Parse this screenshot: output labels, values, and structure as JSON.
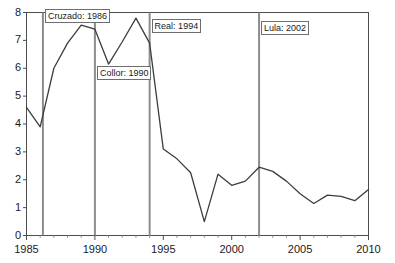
{
  "chart_data": {
    "type": "line",
    "title": "",
    "subtitle": "",
    "xlabel": "",
    "ylabel": "",
    "xlim": [
      1985,
      2010
    ],
    "ylim": [
      0,
      8
    ],
    "grid": false,
    "legend_position": "none",
    "y_ticks": [
      0,
      1,
      2,
      3,
      4,
      5,
      6,
      7,
      8
    ],
    "y_tick_labels": [
      "0",
      "1",
      "2",
      "3",
      "4",
      "5",
      "6",
      "7",
      "8"
    ],
    "x_ticks": [
      1985,
      1990,
      1995,
      2000,
      2005,
      2010
    ],
    "x_tick_labels": [
      "1985",
      "1990",
      "1995",
      "2000",
      "2005",
      "2010"
    ],
    "x_minor_tick_step": 1,
    "line_color": "#3d3d3d",
    "event_line_color": "#8c8c8c",
    "axis_color": "#4d4d4d",
    "x": [
      1985,
      1986,
      1987,
      1988,
      1989,
      1990,
      1991,
      1992,
      1993,
      1994,
      1995,
      1996,
      1997,
      1998,
      1999,
      2000,
      2001,
      2002,
      2003,
      2004,
      2005,
      2006,
      2007,
      2008,
      2009,
      2010
    ],
    "values": [
      4.6,
      3.9,
      6.0,
      6.9,
      7.55,
      7.4,
      6.15,
      6.95,
      7.8,
      6.9,
      3.1,
      2.75,
      2.25,
      0.5,
      2.2,
      1.8,
      1.95,
      2.45,
      2.3,
      1.95,
      1.5,
      1.15,
      1.45,
      1.4,
      1.25,
      1.65
    ],
    "series": [
      {
        "name": "series-1",
        "values": [
          4.6,
          3.9,
          6.0,
          6.9,
          7.55,
          7.4,
          6.15,
          6.95,
          7.8,
          6.9,
          3.1,
          2.75,
          2.25,
          0.5,
          2.2,
          1.8,
          1.95,
          2.45,
          2.3,
          1.95,
          1.5,
          1.15,
          1.45,
          1.4,
          1.25,
          1.65
        ]
      }
    ],
    "annotations": [
      {
        "id": "cruzado",
        "label": "Cruzado: 1986",
        "x": 1986.2,
        "boxed": true
      },
      {
        "id": "collor",
        "label": "Collor: 1990",
        "x": 1990.0,
        "boxed": true
      },
      {
        "id": "real",
        "label": "Real: 1994",
        "x": 1994.0,
        "boxed": true
      },
      {
        "id": "lula",
        "label": "Lula: 2002",
        "x": 2002.0,
        "boxed": true
      }
    ]
  },
  "axis": {
    "y_labels": [
      "8",
      "7",
      "6",
      "5",
      "4",
      "3",
      "2",
      "1",
      "0"
    ],
    "x_labels": [
      "1985",
      "1990",
      "1995",
      "2000",
      "2005",
      "2010"
    ]
  },
  "events": {
    "cruzado": "Cruzado: 1986",
    "collor": "Collor: 1990",
    "real": "Real: 1994",
    "lula": "Lula: 2002"
  }
}
